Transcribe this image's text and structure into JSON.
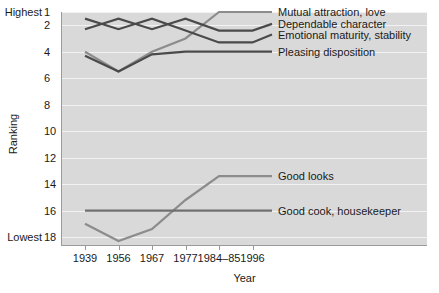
{
  "chart_data": {
    "type": "line",
    "title": "",
    "xlabel": "Year",
    "ylabel": "Ranking",
    "categories": [
      "1939",
      "1956",
      "1967",
      "1977",
      "1984–85",
      "1996"
    ],
    "ylim": [
      1,
      18.6
    ],
    "y_inverted": true,
    "grid": true,
    "legend_position": "right-of-plot (direct line labels)",
    "y_ticks": [
      "1",
      "2",
      "4",
      "6",
      "8",
      "10",
      "12",
      "14",
      "16",
      "18"
    ],
    "y_tick_values": [
      1,
      2,
      4,
      6,
      8,
      10,
      12,
      14,
      16,
      18
    ],
    "y_edge_labels": {
      "top": "Highest",
      "bottom": "Lowest"
    },
    "y_edge_values": {
      "top": 1,
      "bottom": 18
    },
    "series": [
      {
        "name": "Mutual attraction, love",
        "color": "#8c8c8c",
        "values": [
          4.0,
          5.5,
          4.0,
          3.0,
          1.0,
          1.0
        ],
        "label_value": 1.0
      },
      {
        "name": "Dependable character",
        "color": "#4a4a4a",
        "values": [
          2.3,
          1.5,
          2.3,
          1.5,
          2.4,
          2.4
        ],
        "label_value": 1.9
      },
      {
        "name": "Emotional maturity, stability",
        "color": "#4a4a4a",
        "values": [
          1.5,
          2.3,
          1.5,
          2.4,
          3.3,
          3.3
        ],
        "label_value": 2.7
      },
      {
        "name": "Pleasing disposition",
        "color": "#4a4a4a",
        "values": [
          4.3,
          5.5,
          4.2,
          4.0,
          4.0,
          4.0
        ],
        "label_value": 4.0
      },
      {
        "name": "Good looks",
        "color": "#8c8c8c",
        "values": [
          17.0,
          18.3,
          17.4,
          15.2,
          13.4,
          13.4
        ],
        "label_value": 13.4
      },
      {
        "name": "Good cook, housekeeper",
        "color": "#6e6e6e",
        "values": [
          16.0,
          16.0,
          16.0,
          16.0,
          16.0,
          16.0
        ],
        "label_value": 16.0
      }
    ]
  },
  "colors": {
    "plot_background": "#d9d9d9",
    "gridline": "#f2f2f2",
    "axis": "#9a9a9a",
    "text": "#1a1a1a",
    "series_light": "#8c8c8c",
    "series_dark": "#4a4a4a"
  }
}
